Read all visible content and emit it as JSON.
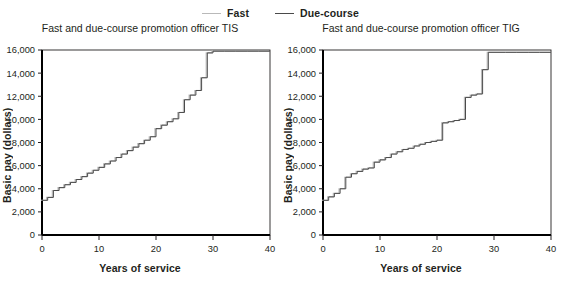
{
  "legend": {
    "items": [
      {
        "label": "Fast",
        "color": "#b9b9b9",
        "icon": "line-swatch-icon"
      },
      {
        "label": "Due-course",
        "color": "#4a4a4a",
        "icon": "line-swatch-icon"
      }
    ]
  },
  "panels": [
    {
      "id": "tis",
      "title": "Fast and due-course promotion officer TIS",
      "xlabel": "Years of service",
      "ylabel": "Basic pay (dollars)"
    },
    {
      "id": "tig",
      "title": "Fast and due-course promotion officer TIG",
      "xlabel": "Years of service",
      "ylabel": "Basic pay (dollars)"
    }
  ],
  "chart_data": [
    {
      "type": "line",
      "subtype": "step",
      "title": "Fast and due-course promotion officer TIS",
      "xlabel": "Years of service",
      "ylabel": "Basic pay (dollars)",
      "xlim": [
        0,
        40
      ],
      "ylim": [
        0,
        16000
      ],
      "xticks": [
        0,
        10,
        20,
        30,
        40
      ],
      "xticklabels": [
        "0",
        "10",
        "20",
        "30",
        "40"
      ],
      "yticks": [
        0,
        2000,
        4000,
        6000,
        8000,
        10000,
        12000,
        14000,
        16000
      ],
      "yticklabels": [
        "0",
        "2,000",
        "4,000",
        "6,000",
        "8,000",
        "10,000",
        "12,000",
        "14,000",
        "16,000"
      ],
      "grid": false,
      "legend_position": "top-center-outside",
      "series": [
        {
          "name": "Fast",
          "color": "#b9b9b9",
          "x": [
            0,
            1,
            2,
            3,
            4,
            5,
            6,
            7,
            8,
            9,
            10,
            11,
            12,
            13,
            14,
            15,
            16,
            17,
            18,
            19,
            20,
            21,
            22,
            23,
            24,
            25,
            26,
            27,
            28,
            29,
            30,
            32,
            34,
            36,
            38
          ],
          "y": [
            3000,
            3250,
            3850,
            4100,
            4350,
            4550,
            4800,
            5050,
            5350,
            5600,
            5850,
            6150,
            6400,
            6700,
            7000,
            7300,
            7600,
            7900,
            8200,
            8500,
            9200,
            9500,
            9800,
            10050,
            10600,
            11700,
            12100,
            12500,
            13600,
            15750,
            15900,
            15900,
            15900,
            15900,
            15900
          ]
        },
        {
          "name": "Due-course",
          "color": "#4a4a4a",
          "x": [
            0,
            1,
            2,
            3,
            4,
            5,
            6,
            7,
            8,
            9,
            10,
            11,
            12,
            13,
            14,
            15,
            16,
            17,
            18,
            19,
            20,
            21,
            22,
            23,
            24,
            25,
            26,
            27,
            28,
            29,
            30,
            32,
            34,
            36,
            38
          ],
          "y": [
            3000,
            3250,
            3850,
            4100,
            4350,
            4550,
            4800,
            5050,
            5350,
            5600,
            5850,
            6150,
            6400,
            6700,
            7000,
            7300,
            7600,
            7900,
            8200,
            8500,
            9200,
            9500,
            9800,
            10050,
            10600,
            11700,
            12100,
            12500,
            13600,
            15750,
            15900,
            15900,
            15900,
            15900,
            15900
          ]
        }
      ]
    },
    {
      "type": "line",
      "subtype": "step",
      "title": "Fast and due-course promotion officer TIG",
      "xlabel": "Years of service",
      "ylabel": "Basic pay (dollars)",
      "xlim": [
        0,
        40
      ],
      "ylim": [
        0,
        16000
      ],
      "xticks": [
        0,
        10,
        20,
        30,
        40
      ],
      "xticklabels": [
        "0",
        "10",
        "20",
        "30",
        "40"
      ],
      "yticks": [
        0,
        2000,
        4000,
        6000,
        8000,
        10000,
        12000,
        14000,
        16000
      ],
      "yticklabels": [
        "0",
        "2,000",
        "4,000",
        "6,000",
        "8,000",
        "10,000",
        "12,000",
        "14,000",
        "16,000"
      ],
      "grid": false,
      "legend_position": "top-center-outside",
      "series": [
        {
          "name": "Fast",
          "color": "#b9b9b9",
          "x": [
            0,
            1,
            2,
            3,
            4,
            5,
            6,
            7,
            8,
            9,
            10,
            11,
            12,
            13,
            14,
            15,
            16,
            17,
            18,
            19,
            20,
            21,
            22,
            23,
            24,
            25,
            26,
            27,
            28,
            29,
            30,
            32,
            34,
            36,
            38
          ],
          "y": [
            3000,
            3300,
            3600,
            4000,
            5000,
            5300,
            5500,
            5700,
            5800,
            6300,
            6500,
            6700,
            7000,
            7200,
            7400,
            7500,
            7700,
            7850,
            8000,
            8100,
            8200,
            9700,
            9800,
            9900,
            10000,
            11900,
            12100,
            12200,
            14300,
            15800,
            15800,
            15800,
            15800,
            15800,
            15800
          ]
        },
        {
          "name": "Due-course",
          "color": "#4a4a4a",
          "x": [
            0,
            1,
            2,
            3,
            4,
            5,
            6,
            7,
            8,
            9,
            10,
            11,
            12,
            13,
            14,
            15,
            16,
            17,
            18,
            19,
            20,
            21,
            22,
            23,
            24,
            25,
            26,
            27,
            28,
            29,
            30,
            32,
            34,
            36,
            38
          ],
          "y": [
            3000,
            3300,
            3600,
            4000,
            5000,
            5300,
            5500,
            5700,
            5800,
            6300,
            6500,
            6700,
            7000,
            7200,
            7400,
            7500,
            7700,
            7850,
            8000,
            8100,
            8200,
            9700,
            9800,
            9900,
            10000,
            11900,
            12100,
            12200,
            14300,
            15800,
            15800,
            15800,
            15800,
            15800,
            15800
          ]
        }
      ]
    }
  ]
}
